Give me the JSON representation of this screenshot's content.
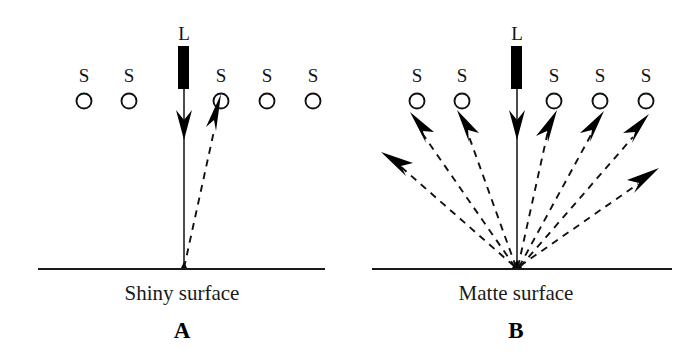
{
  "figure": {
    "background_color": "#ffffff",
    "ink_color": "#000000"
  },
  "panels": [
    {
      "id": "A",
      "letter": "A",
      "caption": "Shiny surface",
      "light_source": {
        "label": "L",
        "name": "light-source-lamp",
        "bar": {
          "x": 178,
          "y": 46,
          "width": 11,
          "height": 43
        }
      },
      "sensors": [
        {
          "label": "S",
          "cx": 84,
          "cy": 101,
          "r": 7.5,
          "receives_ray": false
        },
        {
          "label": "S",
          "cx": 129,
          "cy": 101,
          "r": 7.5,
          "receives_ray": false
        },
        {
          "label": "S",
          "cx": 221,
          "cy": 101,
          "r": 7.5,
          "receives_ray": true
        },
        {
          "label": "S",
          "cx": 267,
          "cy": 101,
          "r": 7.5,
          "receives_ray": false
        },
        {
          "label": "S",
          "cx": 313,
          "cy": 101,
          "r": 7.5,
          "receives_ray": false
        }
      ],
      "surface": {
        "x1": 38,
        "x2": 325,
        "y": 269
      },
      "incident_ray": {
        "x1": 184,
        "y1": 89,
        "x2": 184,
        "y2": 269
      },
      "reflected_rays": [
        {
          "x1": 184,
          "y1": 268,
          "x2": 216,
          "y2": 125,
          "to_sensor": 3
        }
      ],
      "caption_x": 182,
      "caption_y": 300,
      "letter_x": 182,
      "letter_y": 338
    },
    {
      "id": "B",
      "letter": "B",
      "caption": "Matte surface",
      "light_source": {
        "label": "L",
        "name": "light-source-lamp",
        "bar": {
          "x": 511,
          "y": 46,
          "width": 11,
          "height": 43
        }
      },
      "sensors": [
        {
          "label": "S",
          "cx": 417,
          "cy": 101,
          "r": 7.5,
          "receives_ray": true
        },
        {
          "label": "S",
          "cx": 462,
          "cy": 101,
          "r": 7.5,
          "receives_ray": true
        },
        {
          "label": "S",
          "cx": 554,
          "cy": 101,
          "r": 7.5,
          "receives_ray": true
        },
        {
          "label": "S",
          "cx": 600,
          "cy": 101,
          "r": 7.5,
          "receives_ray": true
        },
        {
          "label": "S",
          "cx": 646,
          "cy": 101,
          "r": 7.5,
          "receives_ray": true
        }
      ],
      "surface": {
        "x1": 372,
        "x2": 672,
        "y": 269
      },
      "incident_ray": {
        "x1": 517,
        "y1": 89,
        "x2": 517,
        "y2": 269
      },
      "reflected_rays": [
        {
          "x1": 517,
          "y1": 268,
          "x2": 390,
          "y2": 156,
          "to_sensor": null
        },
        {
          "x1": 517,
          "y1": 268,
          "x2": 415,
          "y2": 122,
          "to_sensor": 0
        },
        {
          "x1": 517,
          "y1": 268,
          "x2": 461,
          "y2": 120,
          "to_sensor": 1
        },
        {
          "x1": 517,
          "y1": 268,
          "x2": 553,
          "y2": 120,
          "to_sensor": 2
        },
        {
          "x1": 517,
          "y1": 268,
          "x2": 598,
          "y2": 121,
          "to_sensor": 3
        },
        {
          "x1": 517,
          "y1": 268,
          "x2": 643,
          "y2": 124,
          "to_sensor": 4
        },
        {
          "x1": 517,
          "y1": 268,
          "x2": 654,
          "y2": 173,
          "to_sensor": null
        }
      ],
      "caption_x": 516,
      "caption_y": 300,
      "letter_x": 516,
      "letter_y": 338
    }
  ],
  "legend_terms": {
    "sensor_symbol": "S",
    "lamp_symbol": "L"
  }
}
